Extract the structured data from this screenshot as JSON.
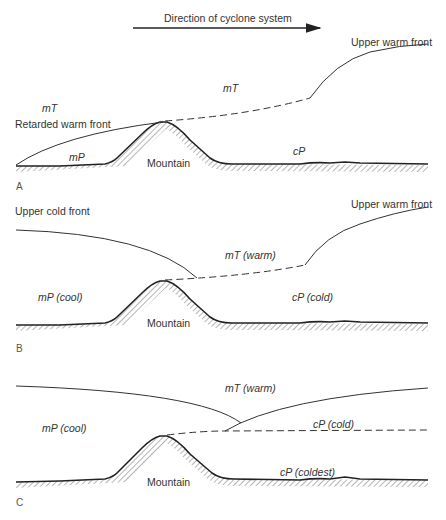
{
  "header": {
    "direction_label": "Direction of cyclone system"
  },
  "panels": [
    {
      "letter": "A",
      "labels": {
        "upper_warm_front": "Upper warm front",
        "retarded_warm_front": "Retarded warm front",
        "air_mass_left_upper": "mT",
        "air_mass_center_upper": "mT",
        "air_mass_left_lower": "mP",
        "air_mass_right_lower": "cP",
        "mountain": "Mountain"
      }
    },
    {
      "letter": "B",
      "labels": {
        "upper_cold_front": "Upper cold front",
        "upper_warm_front": "Upper warm front",
        "air_mass_center_upper": "mT (warm)",
        "air_mass_left": "mP (cool)",
        "air_mass_right": "cP (cold)",
        "mountain": "Mountain"
      }
    },
    {
      "letter": "C",
      "labels": {
        "air_mass_center_upper": "mT (warm)",
        "air_mass_left": "mP (cool)",
        "air_mass_right_middle": "cP (cold)",
        "air_mass_right_lower": "cP (coldest)",
        "mountain": "Mountain"
      }
    }
  ],
  "colors": {
    "line": "#2a2a2a",
    "hatch": "#6a6a6a",
    "background": "#ffffff"
  }
}
